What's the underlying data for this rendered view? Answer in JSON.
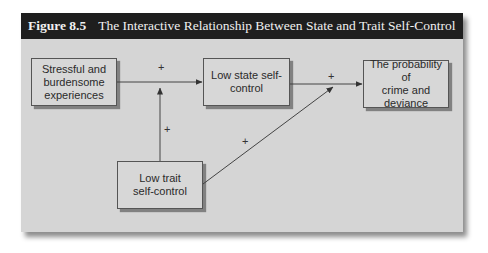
{
  "figure": {
    "number": "Figure 8.5",
    "title": "The Interactive Relationship Between State and Trait Self-Control"
  },
  "nodes": {
    "stress": {
      "lines": [
        "Stressful and",
        "burdensome",
        "experiences"
      ]
    },
    "state": {
      "lines": [
        "Low state self-",
        "control"
      ]
    },
    "outcome": {
      "lines": [
        "The probability of",
        "crime and",
        "deviance"
      ]
    },
    "trait": {
      "lines": [
        "Low trait",
        "self-control"
      ]
    }
  },
  "edges": [
    {
      "from": "stress",
      "to": "state",
      "sign": "+"
    },
    {
      "from": "trait",
      "to": "stress-state-edge",
      "sign": "+"
    },
    {
      "from": "state",
      "to": "outcome",
      "sign": "+"
    },
    {
      "from": "trait",
      "to": "state-outcome-edge",
      "sign": "+"
    }
  ],
  "colors": {
    "header_bg": "#1e1e1e",
    "header_text": "#f0f0f0",
    "panel_bg": "#d5d5d5",
    "line": "#444444"
  }
}
